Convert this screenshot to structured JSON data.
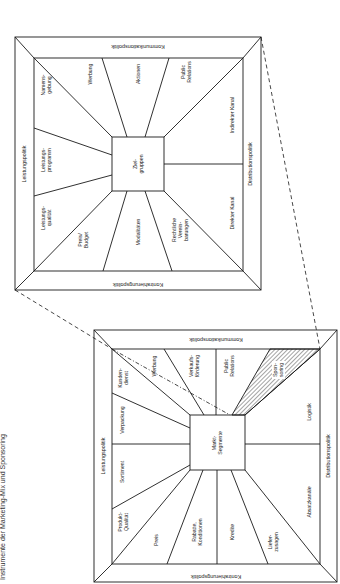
{
  "caption": "Instrumente der Marketing-Mix und Sponsoring",
  "lower_diagram": {
    "center": [
      "Markt-",
      "Segmente"
    ],
    "frame": {
      "left": "Leistungspolitik",
      "top": "Kommunikationspolitik",
      "right": "Distributionspolitik",
      "bottom": "Kontrahierungspolitik"
    },
    "segments": {
      "produkt_qualitaet": [
        "Produkt-",
        "Qualität"
      ],
      "sortiment": [
        "Sortiment"
      ],
      "verpackung": [
        "Verpackung"
      ],
      "kundendienst": [
        "Kunden-",
        "dienst"
      ],
      "werbung": [
        "Werbung"
      ],
      "verkaufsfoerderung": [
        "Verkaufs-",
        "förderung"
      ],
      "public_relations": [
        "Public",
        "Relations"
      ],
      "sponsoring": [
        "Spon-",
        "soring"
      ],
      "logistik": [
        "Logistik"
      ],
      "absatzkanaele": [
        "Absatzkanäle"
      ],
      "lieferzusagen": [
        "Liefer-",
        "zusagen"
      ],
      "kredite": [
        "Kredite"
      ],
      "rabatte": [
        "Rabatte,",
        "Konditionen"
      ],
      "preis": [
        "Preis"
      ]
    },
    "highlight": "sponsoring"
  },
  "upper_diagram": {
    "center": [
      "Ziel-",
      "gruppen"
    ],
    "frame": {
      "left": "Leistungspolitik",
      "top": "Kommunikationspolitik",
      "right": "Distributionspolitik",
      "bottom": "Kontrahierungspolitik"
    },
    "segments": {
      "namensgebung": [
        "Namens-",
        "gebung"
      ],
      "werbung": [
        "Werbung"
      ],
      "aktionen": [
        "Aktionen"
      ],
      "public_relations": [
        "Public",
        "Relations"
      ],
      "indirekter_kanal": [
        "Indirekter Kanal"
      ],
      "direkter_kanal": [
        "Direkter Kanal"
      ],
      "rechtliche": [
        "Rechtliche",
        "Verein-",
        "barungen"
      ],
      "modalitaeten": [
        "Modalitäten"
      ],
      "preis_budget": [
        "Preis/",
        "Budget"
      ],
      "leistungsqualitaet": [
        "Leistungs-",
        "qualität"
      ],
      "leistungsprogramm": [
        "Leistungs-",
        "programm"
      ]
    }
  },
  "colors": {
    "line": "#1a1a1a",
    "hatch": "#1a1a1a",
    "background": "#ffffff"
  }
}
